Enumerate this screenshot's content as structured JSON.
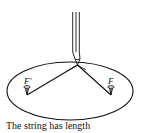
{
  "diagram": {
    "labels": {
      "left_focus": "F'",
      "right_focus": "F"
    },
    "caption": "The string has length",
    "elements": [
      "pencil",
      "ellipse",
      "string",
      "pin-left",
      "pin-right"
    ],
    "colors": {
      "ink": "#111111",
      "background": "#ffffff"
    }
  }
}
